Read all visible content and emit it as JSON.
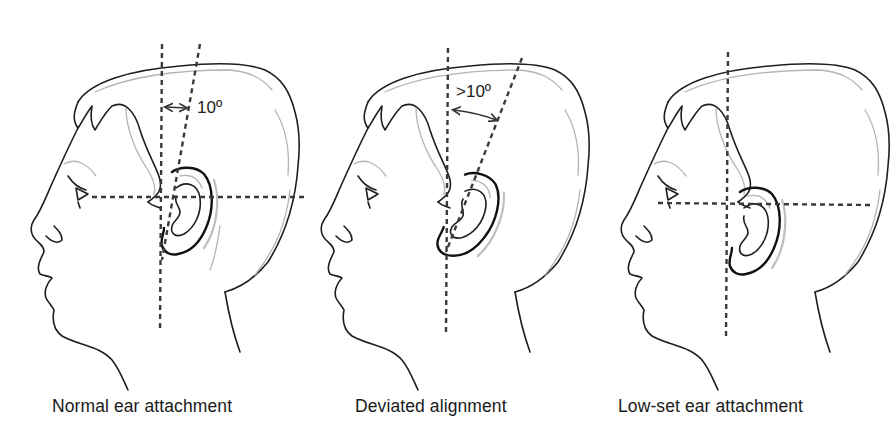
{
  "figure": {
    "panels": [
      {
        "id": "normal",
        "caption": "Normal ear attachment",
        "angle_label": "10º",
        "reference_lines": [
          "vertical-plumb-line",
          "ear-axis-line-tilted-10deg",
          "horizontal-eye-canthus-line"
        ]
      },
      {
        "id": "deviated",
        "caption": "Deviated alignment",
        "angle_label": ">10º",
        "reference_lines": [
          "vertical-plumb-line",
          "ear-axis-line-tilted-over-10deg"
        ]
      },
      {
        "id": "low-set",
        "caption": "Low-set ear attachment",
        "angle_label": "",
        "reference_lines": [
          "vertical-plumb-line",
          "horizontal-eye-canthus-line"
        ]
      }
    ],
    "colors": {
      "background": "#ffffff",
      "line": "#1e1e1e",
      "dashed_reference": "#3a3a3a",
      "shading": "#b4b4b4"
    }
  }
}
